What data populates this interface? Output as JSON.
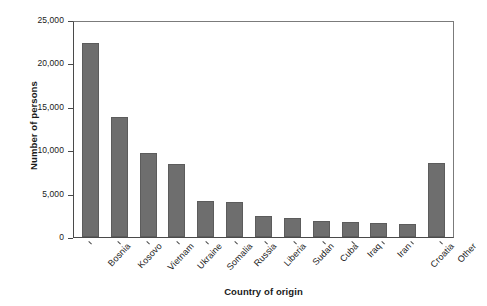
{
  "chart_data": {
    "type": "bar",
    "title": "",
    "xlabel": "Country of origin",
    "ylabel": "Number of persons",
    "categories": [
      "Bosnia",
      "Kosovo",
      "Vietnam",
      "Ukraine",
      "Somalia",
      "Russia",
      "Liberia",
      "Sudan",
      "Cuba",
      "Iraq",
      "Iran",
      "Croatia",
      "Other"
    ],
    "values": [
      22600,
      14000,
      9800,
      8500,
      4200,
      4100,
      2400,
      2200,
      1900,
      1800,
      1600,
      1500,
      8600
    ],
    "ylim": [
      0,
      25000
    ],
    "yticks": [
      0,
      5000,
      10000,
      15000,
      20000,
      25000
    ],
    "ytick_labels": [
      "0",
      "5,000",
      "10,000",
      "15,000",
      "20,000",
      "25,000"
    ],
    "grid": false,
    "legend": null,
    "bar_color": "#6e6e6e",
    "axis_color": "#4a4a4a"
  }
}
